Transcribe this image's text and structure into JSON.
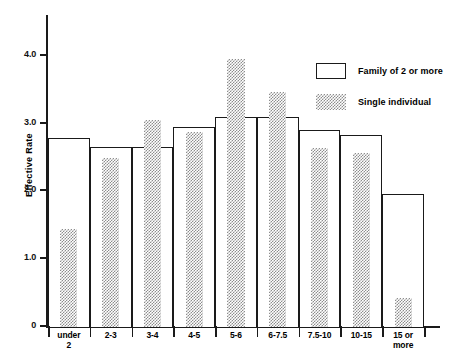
{
  "chart_data": {
    "type": "bar",
    "title": "",
    "xlabel": "",
    "ylabel": "Effective Rate",
    "ylim": [
      0,
      4.6
    ],
    "yticks": [
      "0",
      "1.0",
      "2.0",
      "3.0",
      "4.0"
    ],
    "ytick_values": [
      0,
      1.0,
      2.0,
      3.0,
      4.0
    ],
    "grid": false,
    "legend_position": "top-right",
    "categories": [
      "under\n2",
      "2-3",
      "3-4",
      "4-5",
      "5-6",
      "6-7.5",
      "7.5-10",
      "10-15",
      "15 or\nmore"
    ],
    "series": [
      {
        "name": "Family of 2 or more",
        "style": "open-outline",
        "values": [
          2.78,
          2.66,
          2.65,
          2.95,
          3.1,
          3.1,
          2.9,
          2.83,
          1.96
        ]
      },
      {
        "name": "Single individual",
        "style": "stippled",
        "values": [
          1.45,
          2.49,
          3.05,
          2.88,
          3.95,
          3.47,
          2.64,
          2.56,
          0.43
        ]
      }
    ]
  },
  "legend": {
    "items": [
      {
        "label": "Family of 2 or more",
        "swatch": "open-rectangle-swatch"
      },
      {
        "label": "Single individual",
        "swatch": "stippled-rectangle-swatch"
      }
    ]
  },
  "axes": {
    "y_title": "Effective Rate"
  },
  "colors": {
    "ink": "#1a1a1a",
    "stipple": "#8d8d8d",
    "background": "#ffffff"
  }
}
